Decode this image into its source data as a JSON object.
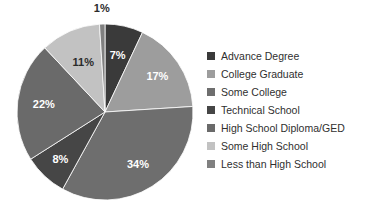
{
  "chart_data": {
    "type": "pie",
    "title": "",
    "legend_position": "right",
    "start_angle_deg": 0,
    "direction": "clockwise",
    "categories": [
      "Advance Degree",
      "College Graduate",
      "Some College",
      "Technical School",
      "High School Diploma/GED",
      "Some High School",
      "Less than High School"
    ],
    "values": [
      7,
      17,
      34,
      8,
      22,
      11,
      1
    ],
    "value_unit": "%",
    "slices": [
      {
        "label": "Advance Degree",
        "value": 7,
        "display": "7%",
        "color": "#3a3a3a",
        "label_color": "#ffffff"
      },
      {
        "label": "College Graduate",
        "value": 17,
        "display": "17%",
        "color": "#9d9d9d",
        "label_color": "#ffffff"
      },
      {
        "label": "Some College",
        "value": 34,
        "display": "34%",
        "color": "#6e6e6e",
        "label_color": "#ffffff"
      },
      {
        "label": "Technical School",
        "value": 8,
        "display": "8%",
        "color": "#464646",
        "label_color": "#ffffff"
      },
      {
        "label": "High School Diploma/GED",
        "value": 22,
        "display": "22%",
        "color": "#6a6a6a",
        "label_color": "#ffffff"
      },
      {
        "label": "Some High School",
        "value": 11,
        "display": "11%",
        "color": "#c2c2c2",
        "label_color": "#2b2b2b"
      },
      {
        "label": "Less than High School",
        "value": 1,
        "display": "1%",
        "color": "#808080",
        "label_color": "#2b2b2b"
      }
    ],
    "total": 100
  },
  "legend": {
    "items": [
      {
        "label": "Advance Degree",
        "color": "#3a3a3a"
      },
      {
        "label": "College Graduate",
        "color": "#9d9d9d"
      },
      {
        "label": "Some College",
        "color": "#6e6e6e"
      },
      {
        "label": "Technical School",
        "color": "#464646"
      },
      {
        "label": "High School Diploma/GED",
        "color": "#6a6a6a"
      },
      {
        "label": "Some High School",
        "color": "#c2c2c2"
      },
      {
        "label": "Less than High School",
        "color": "#808080"
      }
    ]
  },
  "pie_geometry": {
    "center_x": 105,
    "center_y": 112,
    "radius": 88
  }
}
